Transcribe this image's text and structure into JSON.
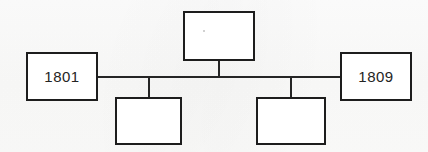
{
  "diagram": {
    "background_color": "#fdfdfc",
    "line_color": "#252525",
    "border_color": "#1d1d1d",
    "nodes": [
      {
        "id": "top-center",
        "label": "",
        "x": 183,
        "y": 11,
        "width": 72,
        "height": 50
      },
      {
        "id": "left",
        "label": "1801",
        "x": 26,
        "y": 52,
        "width": 72,
        "height": 49
      },
      {
        "id": "right",
        "label": "1809",
        "x": 340,
        "y": 52,
        "width": 72,
        "height": 49
      },
      {
        "id": "bottom-left",
        "label": "",
        "x": 115,
        "y": 97,
        "width": 67,
        "height": 48
      },
      {
        "id": "bottom-right",
        "label": "",
        "x": 256,
        "y": 97,
        "width": 70,
        "height": 48
      }
    ],
    "connectors": [
      {
        "id": "trunk-line",
        "orientation": "horizontal",
        "x": 98,
        "y": 76,
        "length": 242
      },
      {
        "id": "stub-top-center",
        "orientation": "vertical",
        "x": 218,
        "y": 61,
        "length": 16
      },
      {
        "id": "stub-bottom-left",
        "orientation": "vertical",
        "x": 148,
        "y": 76,
        "length": 21
      },
      {
        "id": "stub-bottom-right",
        "orientation": "vertical",
        "x": 290,
        "y": 76,
        "length": 21
      }
    ]
  }
}
